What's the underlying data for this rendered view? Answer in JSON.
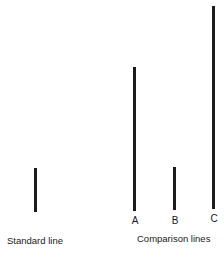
{
  "diagram": {
    "standard": {
      "caption": "Standard line",
      "line": {
        "x": 34,
        "y1": 168,
        "y2": 212
      }
    },
    "comparison": {
      "caption": "Comparison lines",
      "lines": [
        {
          "label": "A",
          "x": 133,
          "y1": 67,
          "y2": 211
        },
        {
          "label": "B",
          "x": 173,
          "y1": 167,
          "y2": 210
        },
        {
          "label": "C",
          "x": 212,
          "y1": 6,
          "y2": 209
        }
      ]
    },
    "line_color": "#1c1c1c"
  }
}
